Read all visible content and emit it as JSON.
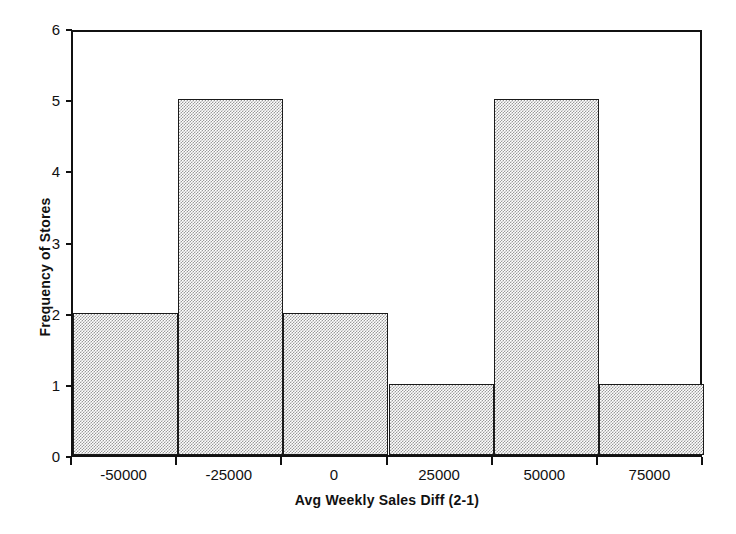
{
  "chart_data": {
    "type": "bar",
    "title": "",
    "subtitle": "",
    "xlabel": "Avg Weekly Sales Diff (2-1)",
    "ylabel": "Frequency of Stores",
    "categories": [
      "-50000",
      "-25000",
      "0",
      "25000",
      "50000",
      "75000"
    ],
    "values": [
      2,
      5,
      2,
      1,
      5,
      1
    ],
    "bin_edges": [
      -62500,
      -37500,
      -12500,
      12500,
      37500,
      62500,
      87500
    ],
    "x_tick_labels": [
      "-50000",
      "-25000",
      "0",
      "25000",
      "50000",
      "75000"
    ],
    "y_tick_labels": [
      "0",
      "1",
      "2",
      "3",
      "4",
      "5",
      "6"
    ],
    "ylim": [
      0,
      6
    ],
    "y_major_step": 1,
    "grid": false,
    "legend": false,
    "legend_position": "none",
    "bar_fill_color": "#c8c8c8",
    "bar_edge_color": "#1a1a1a",
    "axis_color": "#111111",
    "background_color": "#ffffff",
    "label_placement": "centered-between-ticks",
    "total_count": 16
  },
  "axes": {
    "x_title": "Avg Weekly Sales Diff (2-1)",
    "y_title": "Frequency of Stores"
  }
}
